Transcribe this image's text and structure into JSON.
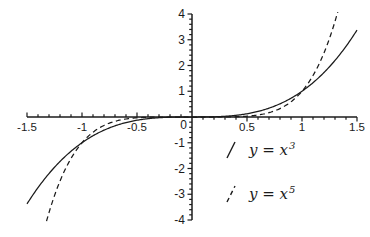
{
  "figure": {
    "background": "#ffffff",
    "ink_color": "#1b1b1b"
  },
  "chart_data": {
    "type": "line",
    "title": "",
    "xlabel": "",
    "ylabel": "",
    "xlim": [
      -1.5,
      1.5
    ],
    "ylim": [
      -4,
      4
    ],
    "grid": false,
    "legend_position": "inside lower-right",
    "x_major_ticks": [
      -1.5,
      -1,
      -0.5,
      0.5,
      1,
      1.5
    ],
    "x_major_labels": [
      "-1.5",
      "-1",
      "-0.5",
      "0.5",
      "1",
      "1.5"
    ],
    "x_minor_step": 0.1,
    "y_major_ticks": [
      -4,
      -3,
      -2,
      -1,
      1,
      2,
      3,
      4
    ],
    "y_major_labels": [
      "-4",
      "-3",
      "-2",
      "-1",
      "1",
      "2",
      "3",
      "4"
    ],
    "y_minor_step": 0.2,
    "origin_label": "0",
    "series": [
      {
        "name": "y = x^3",
        "exponent": 3,
        "line_style": "solid",
        "color": "#1b1b1b",
        "legend_text": "y = x",
        "legend_sup": "3",
        "sample_x": [
          -1.5,
          -1.25,
          -1,
          -0.75,
          -0.5,
          -0.25,
          0,
          0.25,
          0.5,
          0.75,
          1,
          1.25,
          1.5
        ],
        "sample_y": [
          -3.375,
          -1.9531,
          -1,
          -0.4219,
          -0.125,
          -0.0156,
          0,
          0.0156,
          0.125,
          0.4219,
          1,
          1.9531,
          3.375
        ]
      },
      {
        "name": "y = x^5",
        "exponent": 5,
        "line_style": "dashed",
        "color": "#1b1b1b",
        "legend_text": "y = x",
        "legend_sup": "5",
        "sample_x": [
          -1.5,
          -1.25,
          -1,
          -0.75,
          -0.5,
          -0.25,
          0,
          0.25,
          0.5,
          0.75,
          1,
          1.25,
          1.5
        ],
        "sample_y": [
          -7.5938,
          -3.0518,
          -1,
          -0.2373,
          -0.0313,
          -0.001,
          0,
          0.001,
          0.0313,
          0.2373,
          1,
          3.0518,
          7.5938
        ]
      }
    ]
  }
}
